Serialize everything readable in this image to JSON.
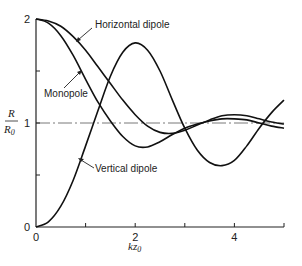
{
  "chart_data": {
    "type": "line",
    "title": "",
    "xlabel": "kz0",
    "ylabel": "R/R0",
    "xlim": [
      0,
      5
    ],
    "ylim": [
      0,
      2
    ],
    "x_ticks": [
      0,
      1,
      2,
      3,
      4,
      5
    ],
    "x_tick_labels": [
      "0",
      "",
      "2",
      "",
      "4",
      ""
    ],
    "y_ticks": [
      0,
      0.5,
      1,
      1.5,
      2
    ],
    "y_tick_labels": [
      "0",
      "",
      "1",
      "",
      "2"
    ],
    "grid": false,
    "reference_line": {
      "y": 1,
      "style": "dash-dot"
    },
    "series": [
      {
        "name": "Horizontal dipole",
        "x": [
          0,
          0.25,
          0.5,
          0.75,
          1.0,
          1.25,
          1.5,
          1.75,
          2.0,
          2.25,
          2.5,
          2.75,
          3.0,
          3.25,
          3.5,
          3.75,
          4.0,
          4.25,
          4.5,
          4.75,
          5.0
        ],
        "y": [
          2.0,
          1.98,
          1.93,
          1.83,
          1.7,
          1.54,
          1.38,
          1.22,
          1.08,
          0.97,
          0.91,
          0.9,
          0.93,
          0.98,
          1.03,
          1.07,
          1.08,
          1.07,
          1.04,
          1.01,
          0.99
        ]
      },
      {
        "name": "Monopole",
        "x": [
          0,
          0.25,
          0.5,
          0.75,
          1.0,
          1.25,
          1.5,
          1.75,
          2.0,
          2.25,
          2.5,
          2.75,
          3.0,
          3.25,
          3.5,
          3.75,
          4.0,
          4.25,
          4.5,
          4.75,
          5.0
        ],
        "y": [
          2.0,
          1.96,
          1.84,
          1.65,
          1.42,
          1.2,
          1.02,
          0.87,
          0.78,
          0.77,
          0.82,
          0.89,
          0.95,
          0.99,
          1.02,
          1.04,
          1.04,
          1.03,
          1.0,
          0.97,
          0.95
        ]
      },
      {
        "name": "Vertical dipole",
        "x": [
          0,
          0.25,
          0.5,
          0.75,
          1.0,
          1.25,
          1.5,
          1.75,
          2.0,
          2.25,
          2.5,
          2.75,
          3.0,
          3.25,
          3.5,
          3.75,
          4.0,
          4.25,
          4.5,
          4.75,
          5.0
        ],
        "y": [
          0.0,
          0.05,
          0.2,
          0.45,
          0.78,
          1.12,
          1.45,
          1.68,
          1.77,
          1.7,
          1.5,
          1.22,
          0.95,
          0.74,
          0.62,
          0.59,
          0.64,
          0.78,
          0.95,
          1.1,
          1.22
        ]
      }
    ],
    "annotations": [
      {
        "text": "Horizontal dipole",
        "points_to": "Horizontal dipole"
      },
      {
        "text": "Monopole",
        "points_to": "Monopole"
      },
      {
        "text": "Vertical dipole",
        "points_to": "Vertical dipole"
      }
    ]
  }
}
